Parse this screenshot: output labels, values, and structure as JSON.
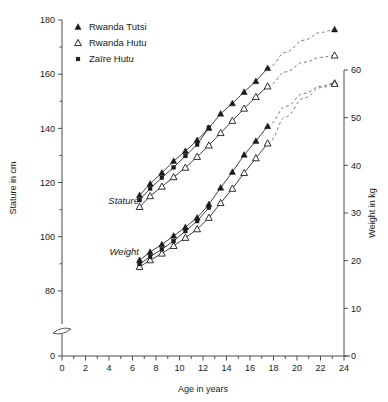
{
  "chart_data": {
    "type": "line",
    "title": "",
    "xlabel": "Age in years",
    "ylabel": "Stature in cm",
    "ylabel_right": "Weight in kg",
    "xlim": [
      0,
      24
    ],
    "ylim": [
      0,
      180
    ],
    "ylim_right": [
      0,
      60
    ],
    "grid": false,
    "legend_position": "top-left",
    "x_ticks": [
      0,
      2,
      4,
      6,
      8,
      10,
      12,
      14,
      16,
      18,
      20,
      22,
      24
    ],
    "x_tick_labels": [
      "0",
      "2",
      "4",
      "6",
      "8",
      "10",
      "12",
      "14",
      "16",
      "18",
      "20",
      "22",
      "24"
    ],
    "x_minor_tick_step": 1,
    "y_ticks_left": [
      0,
      80,
      100,
      120,
      140,
      160,
      180
    ],
    "y_tick_labels_left": [
      "0",
      "80",
      "100",
      "120",
      "140",
      "160",
      "180"
    ],
    "y_minor_ticks_left": [
      90,
      110,
      130,
      150,
      170
    ],
    "y_ticks_right": [
      0,
      10,
      20,
      30,
      40,
      50,
      60
    ],
    "y_tick_labels_right": [
      "0",
      "10",
      "20",
      "30",
      "40",
      "50",
      "60"
    ],
    "axis_break_left": true,
    "axis_break_value": 70,
    "annotations": [
      {
        "text": "Stature",
        "x": 6.55,
        "y_left": 113.5,
        "italic": true,
        "anchor": "end"
      },
      {
        "text": "Weight",
        "x": 6.55,
        "y_left": 94.5,
        "italic": true,
        "anchor": "end"
      }
    ],
    "legend": [
      {
        "label": "Rwanda Tutsi",
        "marker": "filled-triangle"
      },
      {
        "label": "Rwanda Hutu",
        "marker": "open-triangle"
      },
      {
        "label": "Zaïre Hutu",
        "marker": "filled-square"
      }
    ],
    "series": [
      {
        "name": "Rwanda Tutsi",
        "measure": "Stature",
        "axis": "left",
        "marker": "filled-triangle",
        "x": [
          6.6,
          7.5,
          8.5,
          9.5,
          10.5,
          11.5,
          12.5,
          13.5,
          14.5,
          15.5,
          16.5,
          17.5
        ],
        "y": [
          115.3,
          119.5,
          123.6,
          127.9,
          131.6,
          135.6,
          140.1,
          145.4,
          149.2,
          153.4,
          157.4,
          162.2
        ],
        "extrapolated_x": [
          17.5,
          19.0,
          20.5,
          22.0,
          23.2
        ],
        "extrapolated_y": [
          162.2,
          168.0,
          172.5,
          175.4,
          176.5
        ],
        "endpoint_x": 23.2,
        "endpoint_y": 176.5
      },
      {
        "name": "Rwanda Hutu",
        "measure": "Stature",
        "axis": "left",
        "marker": "open-triangle",
        "x": [
          6.6,
          7.5,
          8.5,
          9.5,
          10.5,
          11.5,
          12.5,
          13.5,
          14.5,
          15.5,
          16.5,
          17.5
        ],
        "y": [
          111.0,
          115.0,
          118.5,
          122.0,
          125.5,
          129.5,
          133.7,
          138.3,
          142.8,
          147.3,
          151.6,
          155.5
        ],
        "extrapolated_x": [
          17.5,
          19.0,
          20.5,
          22.0,
          23.2
        ],
        "extrapolated_y": [
          155.5,
          160.8,
          164.3,
          166.2,
          166.9
        ],
        "endpoint_x": 23.2,
        "endpoint_y": 166.9
      },
      {
        "name": "Zaïre Hutu",
        "measure": "Stature",
        "axis": "left",
        "marker": "filled-square",
        "x": [
          6.6,
          7.5,
          8.5,
          9.5,
          10.5,
          11.5,
          12.5
        ],
        "y": [
          113.5,
          117.8,
          121.8,
          125.6,
          129.8,
          134.0,
          140.3
        ],
        "extrapolated_x": [],
        "extrapolated_y": [],
        "endpoint_x": null,
        "endpoint_y": null
      },
      {
        "name": "Rwanda Tutsi",
        "measure": "Weight",
        "axis": "right",
        "marker": "filled-triangle",
        "x": [
          6.6,
          7.5,
          8.5,
          9.5,
          10.5,
          11.5,
          12.5,
          13.5,
          14.5,
          15.5,
          16.5,
          17.5
        ],
        "y_kg": [
          20.1,
          21.8,
          23.4,
          25.2,
          27.0,
          29.0,
          31.8,
          35.3,
          38.6,
          42.2,
          45.1,
          48.2
        ],
        "extrapolated_x": [
          17.5,
          19.0,
          20.5,
          22.0,
          23.2
        ],
        "extrapolated_y_kg": [
          48.2,
          52.3,
          55.0,
          56.6,
          57.3
        ],
        "endpoint_x": 23.2,
        "endpoint_y_kg": 57.3
      },
      {
        "name": "Rwanda Hutu",
        "measure": "Weight",
        "axis": "right",
        "marker": "open-triangle",
        "x": [
          6.6,
          7.5,
          8.5,
          9.5,
          10.5,
          11.5,
          12.5,
          13.5,
          14.5,
          15.5,
          16.5,
          17.5
        ],
        "y_kg": [
          18.7,
          20.1,
          21.5,
          23.1,
          24.8,
          26.6,
          29.0,
          32.1,
          35.1,
          38.4,
          41.5,
          44.6
        ],
        "extrapolated_x": [
          17.5,
          19.0,
          20.5,
          22.0,
          23.2
        ],
        "extrapolated_y_kg": [
          44.6,
          50.1,
          54.0,
          56.3,
          57.1
        ],
        "endpoint_x": 23.2,
        "endpoint_y_kg": 57.1
      },
      {
        "name": "Zaïre Hutu",
        "measure": "Weight",
        "axis": "right",
        "marker": "filled-square",
        "x": [
          6.6,
          7.5,
          8.5,
          9.5,
          10.5,
          11.5,
          12.5
        ],
        "y_kg": [
          19.3,
          20.8,
          22.4,
          24.1,
          26.2,
          28.3,
          31.1
        ],
        "extrapolated_x": [],
        "extrapolated_y_kg": [],
        "endpoint_x": null,
        "endpoint_y_kg": null
      }
    ]
  }
}
